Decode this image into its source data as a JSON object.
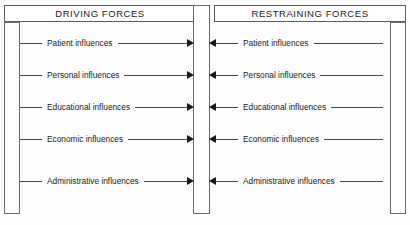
{
  "diagram": {
    "title_left": "DRIVING FORCES",
    "title_right": "RESTRAINING FORCES",
    "rows": [
      {
        "left_label": "Patient influences",
        "right_label": "Patient influences"
      },
      {
        "left_label": "Personal influences",
        "right_label": "Personal influences"
      },
      {
        "left_label": "Educational influences",
        "right_label": "Educational influences"
      },
      {
        "left_label": "Economic influences",
        "right_label": "Economic influences"
      },
      {
        "left_label": "Administrative influences",
        "right_label": "Administrative influences"
      }
    ],
    "colors": {
      "background": "#fdfdfd",
      "border": "#5c5c5c",
      "pillar_border": "#6a6a6a",
      "line": "#4a4a4a",
      "arrowhead": "#1a1a1a",
      "text": "#1a1a1a"
    },
    "icons": {
      "arrow_right": "arrow-right-icon",
      "arrow_left": "arrow-left-icon"
    }
  }
}
